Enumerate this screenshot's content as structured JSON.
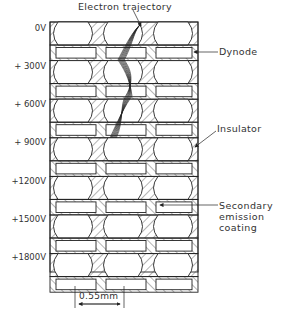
{
  "figure": {
    "title_annotation": "Electron trajectory",
    "voltage_labels": [
      "0V",
      "+ 300V",
      "+ 600V",
      "+ 900V",
      "+1200V",
      "+1500V",
      "+1800V"
    ],
    "callouts": {
      "dynode": "Dynode",
      "insulator": "Insulator",
      "coating": "Secondary\nemission\ncoating"
    },
    "scale_bar": {
      "label": "0.55mm"
    },
    "colors": {
      "line": "#222222",
      "background": "#ffffff"
    }
  }
}
